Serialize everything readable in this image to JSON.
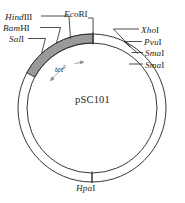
{
  "diagram": {
    "kind": "plasmid-map",
    "plasmid_name": "pSC101",
    "gene_marker": {
      "name": "tet",
      "superscript": "r",
      "full": "tet r"
    },
    "stroke_color": "#231f20",
    "shaded_arc_fill": "#9a9a9a",
    "shaded_arc_stroke": "#231f20",
    "background_color": "#ffffff",
    "text_color": "#231f20"
  },
  "sites": {
    "hindiii": {
      "gene": "Hind",
      "enzyme": "III",
      "label": "HindIII"
    },
    "bamhi": {
      "gene": "Bam",
      "enzyme": "HI",
      "label": "BamHI"
    },
    "sali": {
      "gene": "Sal",
      "enzyme": "I",
      "label": "SalI"
    },
    "ecori": {
      "gene": "Eco",
      "enzyme": "RI",
      "label": "EcoRI"
    },
    "xhoi": {
      "gene": "Xho",
      "enzyme": "I",
      "label": "XhoI"
    },
    "pvui": {
      "gene": "Pvu",
      "enzyme": "I",
      "label": "PvuI"
    },
    "smai_1": {
      "gene": "Sma",
      "enzyme": "I",
      "label": "SmaI"
    },
    "smai_2": {
      "gene": "Sma",
      "enzyme": "I",
      "label": "SmaI"
    },
    "hpai": {
      "gene": "Hpa",
      "enzyme": "I",
      "label": "HpaI"
    }
  }
}
